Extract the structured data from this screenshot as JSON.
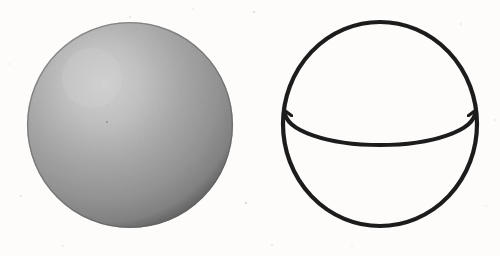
{
  "figure": {
    "background_color": "#fdfcfb",
    "width": 500,
    "height": 256,
    "ink_color": "#1d1d1d",
    "shaded_sphere": {
      "label": "shaded-solid-sphere",
      "center_x": 130,
      "center_y": 125,
      "radius": 103,
      "highlight_x": 92,
      "highlight_y": 78,
      "highlight_color": "#cfcfcf",
      "mid_color": "#a3a3a3",
      "rim_color": "#6d6d6d",
      "edge_color": "#5f5f5f"
    },
    "wireframe_sphere": {
      "label": "wireframe-sphere-with-equator",
      "center_x": 380,
      "center_y": 124,
      "radius_x": 97,
      "radius_y": 102,
      "outline_width": 4.2,
      "equator": {
        "label": "equator-ellipse",
        "radius_x": 94,
        "radius_y": 32,
        "offset_y": -12,
        "front_arc_style": "solid",
        "back_arc_style": "dashed",
        "dash_length": 9,
        "dash_gap": 9,
        "line_width": 4.0
      }
    },
    "speckles": [
      {
        "x": 254,
        "y": 12,
        "r": 1.1,
        "o": 0.3
      },
      {
        "x": 130,
        "y": 17,
        "r": 0.9,
        "o": 0.26
      },
      {
        "x": 193,
        "y": 9,
        "r": 0.8,
        "o": 0.22
      },
      {
        "x": 461,
        "y": 24,
        "r": 0.9,
        "o": 0.2
      },
      {
        "x": 21,
        "y": 196,
        "r": 1.0,
        "o": 0.24
      },
      {
        "x": 246,
        "y": 203,
        "r": 1.2,
        "o": 0.28
      },
      {
        "x": 272,
        "y": 245,
        "r": 0.9,
        "o": 0.2
      },
      {
        "x": 486,
        "y": 206,
        "r": 0.8,
        "o": 0.18
      },
      {
        "x": 63,
        "y": 246,
        "r": 0.9,
        "o": 0.18
      },
      {
        "x": 352,
        "y": 246,
        "r": 0.8,
        "o": 0.16
      },
      {
        "x": 9,
        "y": 64,
        "r": 0.8,
        "o": 0.16
      },
      {
        "x": 495,
        "y": 120,
        "r": 0.9,
        "o": 0.16
      }
    ]
  }
}
